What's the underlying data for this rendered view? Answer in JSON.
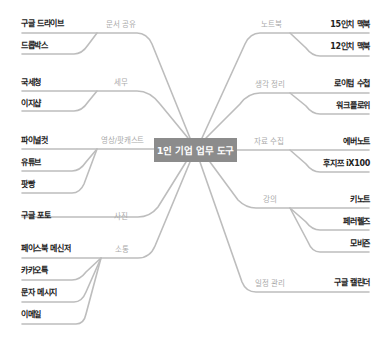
{
  "center": {
    "title": "1인 기업 업무 도구"
  },
  "colors": {
    "center_box": "#8c8c8c",
    "lines": "#bdbdbd",
    "leaf_text": "#222222",
    "category_text": "#aaaaaa"
  },
  "left_branches": [
    {
      "category": "문서 공유",
      "items": [
        "구글 드라이브",
        "드롭박스"
      ]
    },
    {
      "category": "세무",
      "items": [
        "국세청",
        "이지샵"
      ]
    },
    {
      "category": "영상/팟캐스트",
      "items": [
        "파이널컷",
        "유튜브",
        "팟빵"
      ]
    },
    {
      "category": "사진",
      "items": [
        "구글 포토"
      ]
    },
    {
      "category": "소통",
      "items": [
        "페이스북 메신저",
        "카카오톡",
        "문자 메시지",
        "이메일"
      ]
    }
  ],
  "right_branches": [
    {
      "category": "노트북",
      "items": [
        "15인치 맥북",
        "12인치 맥북"
      ]
    },
    {
      "category": "생각 정리",
      "items": [
        "로이텀 수첩",
        "워크플로위"
      ]
    },
    {
      "category": "자료 수집",
      "items": [
        "에버노트",
        "후지쯔 iX100"
      ]
    },
    {
      "category": "강의",
      "items": [
        "키노트",
        "페러렐즈",
        "모비즌"
      ]
    },
    {
      "category": "일정 관리",
      "items": [
        "구글 캘린더"
      ]
    }
  ]
}
